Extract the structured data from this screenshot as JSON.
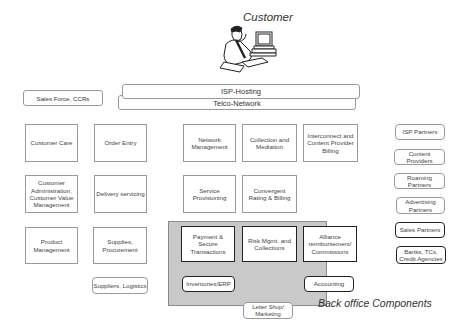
{
  "header": {
    "customer_label": "Customer",
    "customer_icon": "person-at-computer-icon"
  },
  "channels": {
    "sales_force": "Sales Force, CCRs",
    "isp_hosting": "ISP-Hosting",
    "telco_network": "Telco-Network"
  },
  "left_column": [
    "Customer Care",
    "Customer Administration, Customer Value Management",
    "Product Management"
  ],
  "second_column": [
    "Order Entry",
    "Delivery servicing",
    "Supplies, Procurement"
  ],
  "suppliers": "Suppliers, Logistics",
  "center": {
    "network_management": "Network Management",
    "collection_mediation": "Collection and Mediation",
    "interconnect_billing": "Interconnect and Content Provider Billing",
    "service_provisioning": "Service Provisioning",
    "convergent_rating": "Convergent Rating & Billing"
  },
  "back_office": {
    "label": "Back office Components",
    "payment": "Payment & Secure Transactions",
    "risk": "Risk Mgmt. and Collections",
    "alliance": "Alliance reimbursement/ Commissions",
    "inventories": "Inventories/ERP",
    "accounting": "Accounting"
  },
  "letter_shop": "Letter Shop/ Marketing",
  "partners": [
    "ISP Partners",
    "Content Providers",
    "Roaming Partners",
    "Advertising Partners",
    "Sales Partners",
    "Banks, TCs, Credit Agencies"
  ],
  "colors": {
    "back_office_fill": "#c9c9c9",
    "box_border": "#9a9a9a",
    "bold_border": "#222222"
  }
}
